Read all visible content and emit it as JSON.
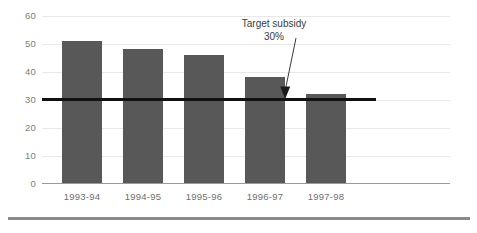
{
  "chart_data": {
    "type": "bar",
    "title": "",
    "subtitle": "",
    "xlabel": "",
    "ylabel": "",
    "categories": [
      "1993-94",
      "1994-95",
      "1995-96",
      "1996-97",
      "1997-98"
    ],
    "values": [
      51,
      48,
      46,
      38,
      32
    ],
    "series": [
      {
        "name": "Subsidy",
        "values": [
          51,
          48,
          46,
          38,
          32
        ]
      }
    ],
    "ylim": [
      0,
      60
    ],
    "yticks": [
      0,
      10,
      20,
      30,
      40,
      50,
      60
    ],
    "ytick_labels": [
      "0",
      "10",
      "20",
      "30",
      "40",
      "50",
      "60"
    ],
    "grid": true,
    "legend": "none",
    "annotations": [
      {
        "text_line1": "Target subsidy",
        "text_line2": "30%",
        "value": 30,
        "kind": "arrow-callout"
      }
    ],
    "reference_lines": [
      {
        "name": "target-subsidy-line",
        "value": 30,
        "label": "Target subsidy 30%",
        "color": "#111111"
      }
    ],
    "colors": {
      "bar": "#585858",
      "target_line": "#111111",
      "gridline": "#e8e8e8",
      "axis": "#9a9a9a",
      "tick_text": "#7d7d7d",
      "annotation_text": "#3a3a3a",
      "bottom_rule": "#8a8a8a",
      "background": "#ffffff"
    }
  }
}
